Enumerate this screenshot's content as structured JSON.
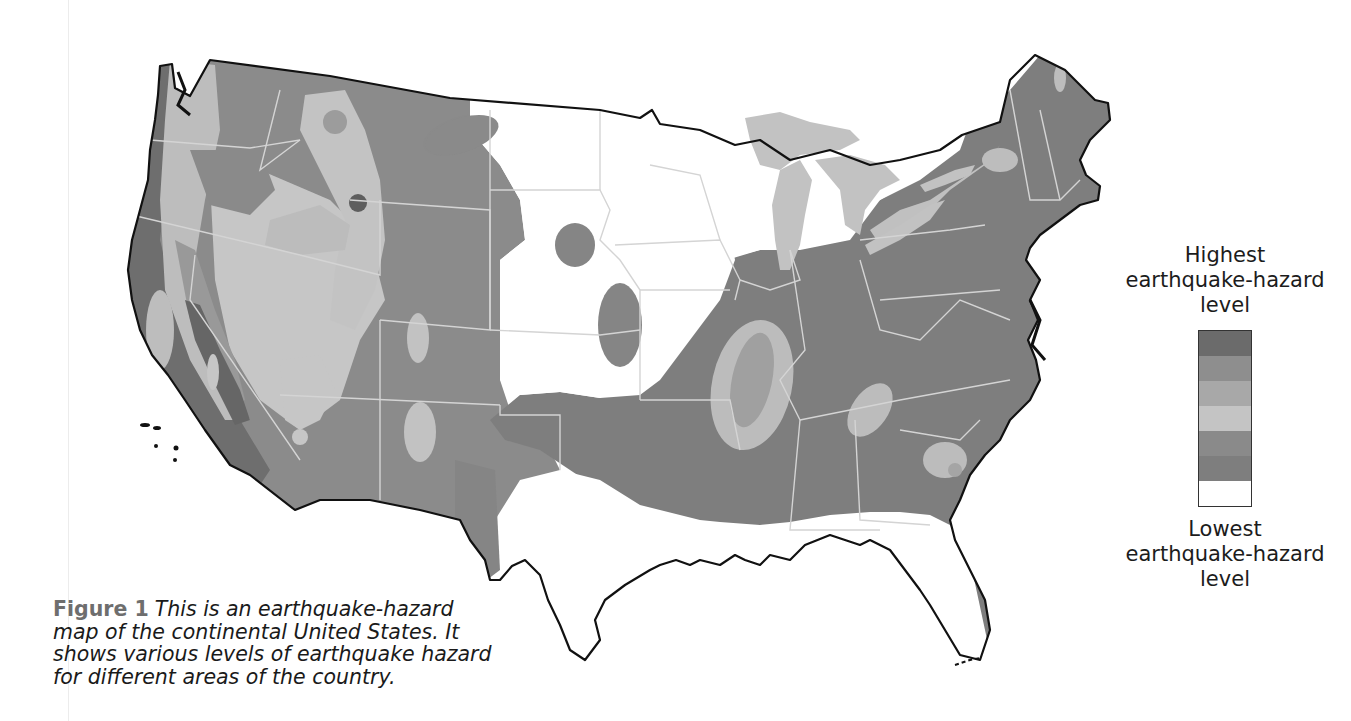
{
  "figure": {
    "label": "Figure 1",
    "caption": "This is an earthquake-hazard map of the continental United States. It shows various levels of earthquake hazard for different areas of the country."
  },
  "legend": {
    "top_label": "Highest earthquake-hazard level",
    "top_label_lines": [
      "Highest",
      "earthquake-hazard",
      "level"
    ],
    "bottom_label_lines": [
      "Lowest",
      "earthquake-hazard",
      "level"
    ],
    "bands": [
      {
        "level": 7,
        "color": "#6b6b6b"
      },
      {
        "level": 6,
        "color": "#8e8e8e"
      },
      {
        "level": 5,
        "color": "#a8a8a8"
      },
      {
        "level": 4,
        "color": "#c4c4c4"
      },
      {
        "level": 3,
        "color": "#8a8a8a"
      },
      {
        "level": 2,
        "color": "#7e7e7e"
      },
      {
        "level": 1,
        "color": "#ffffff"
      }
    ]
  },
  "map": {
    "title": "Earthquake-hazard map of the continental United States",
    "colors": {
      "outline": "#111111",
      "state_border": "#d6d6d6",
      "lakes": "#c2c2c2",
      "lowest": "#ffffff",
      "low": "#7f7f7f",
      "mid": "#8d8d8d",
      "light": "#bdbdbd",
      "lighter": "#cacaca",
      "high": "#9a9a9a",
      "highest": "#5e5e5e"
    }
  }
}
